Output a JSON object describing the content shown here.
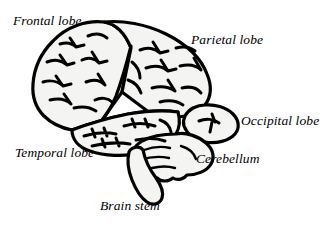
{
  "diagram": {
    "type": "anatomical-illustration",
    "background_color": "#ffffff",
    "outline_color": "#000000",
    "fill_color": "#f4f4f2",
    "sulci_color": "#000000",
    "labels": [
      {
        "id": "frontal",
        "text": "Frontal lobe",
        "structure": "frontal-lobe"
      },
      {
        "id": "parietal",
        "text": "Parietal lobe",
        "structure": "parietal-lobe"
      },
      {
        "id": "occipital",
        "text": "Occipital lobe",
        "structure": "occipital-lobe"
      },
      {
        "id": "temporal",
        "text": "Temporal lobe",
        "structure": "temporal-lobe"
      },
      {
        "id": "cerebellum",
        "text": "Cerebellum",
        "structure": "cerebellum"
      },
      {
        "id": "brainstem",
        "text": "Brain stem",
        "structure": "brain-stem"
      }
    ]
  }
}
